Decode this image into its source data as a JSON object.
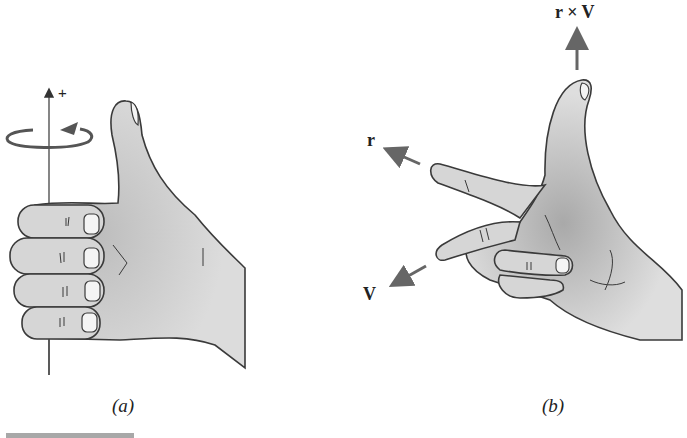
{
  "figure": {
    "panel_a": {
      "caption": "(a)",
      "axis_label": "+",
      "description": "Right hand with curled fingers and thumb up along vertical axis, circular rotation arrow"
    },
    "panel_b": {
      "caption": "(b)",
      "vectors": [
        {
          "label": "r",
          "direction": "index finger"
        },
        {
          "label": "V",
          "direction": "middle finger"
        },
        {
          "label": "r × V",
          "direction": "thumb"
        }
      ]
    }
  },
  "colors": {
    "skin": "#d9d9d9",
    "outline": "#3a3a3a",
    "arrow": "#666666",
    "bar": "#a8a8a8"
  }
}
